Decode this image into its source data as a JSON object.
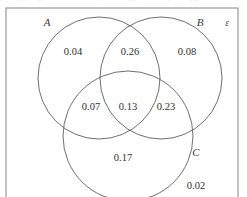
{
  "figure": {
    "kind": "venn-diagram",
    "universe_label": "ε",
    "background_color": "#ffffff",
    "stroke_color": "#5d5d5d",
    "frame_color": "#8f8f8f",
    "text_color": "#2f2f2f"
  },
  "sets": [
    {
      "id": "A",
      "label": "A",
      "label_x": 47,
      "label_y": 26,
      "cx": 99,
      "cy": 78,
      "r": 61
    },
    {
      "id": "B",
      "label": "B",
      "label_x": 200,
      "label_y": 26,
      "cx": 161,
      "cy": 78,
      "r": 61
    },
    {
      "id": "C",
      "label": "C",
      "label_x": 196,
      "label_y": 156,
      "cx": 128,
      "cy": 136,
      "r": 65
    }
  ],
  "frame": {
    "x": 6,
    "y": 8,
    "width": 232,
    "height": 200
  },
  "regions": [
    {
      "id": "A-only",
      "label": "A only",
      "value": "0.04",
      "x": 73,
      "y": 55
    },
    {
      "id": "A-and-B",
      "label": "A and B",
      "value": "0.26",
      "x": 130,
      "y": 55
    },
    {
      "id": "B-only",
      "label": "B only",
      "value": "0.08",
      "x": 187,
      "y": 55
    },
    {
      "id": "A-and-C",
      "label": "A and C",
      "value": "0.07",
      "x": 91,
      "y": 110
    },
    {
      "id": "A-B-and-C",
      "label": "A and B and C",
      "value": "0.13",
      "x": 128,
      "y": 110
    },
    {
      "id": "B-and-C",
      "label": "B and C",
      "value": "0.23",
      "x": 166,
      "y": 110
    },
    {
      "id": "C-only",
      "label": "C only",
      "value": "0.17",
      "x": 123,
      "y": 161
    },
    {
      "id": "outside",
      "label": "outside all sets",
      "value": "0.02",
      "x": 196,
      "y": 189
    }
  ],
  "clipped_header_fragments": [
    {
      "x": 17,
      "text": "•••"
    },
    {
      "x": 38,
      "text": "••"
    },
    {
      "x": 100,
      "text": "•"
    },
    {
      "x": 128,
      "text": "•••"
    },
    {
      "x": 168,
      "text": "•"
    },
    {
      "x": 190,
      "text": "•••"
    }
  ]
}
